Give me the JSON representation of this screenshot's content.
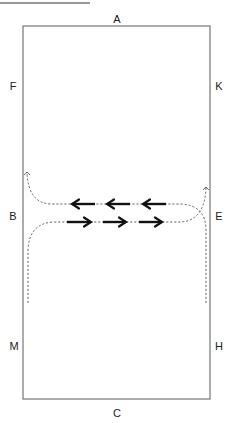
{
  "heading": {
    "text": "EXERCISE 10...",
    "underlined": true,
    "partially_cropped": true
  },
  "arena": {
    "shape": "rectangle",
    "rect": {
      "x": 23,
      "y": 26,
      "width": 187,
      "height": 373
    },
    "stroke_color": "#808080",
    "markers": [
      {
        "letter": "A",
        "x": 117,
        "y": 19
      },
      {
        "letter": "F",
        "x": 13,
        "y": 86
      },
      {
        "letter": "K",
        "x": 219,
        "y": 86
      },
      {
        "letter": "B",
        "x": 13,
        "y": 216
      },
      {
        "letter": "E",
        "x": 219,
        "y": 216
      },
      {
        "letter": "M",
        "x": 14,
        "y": 346
      },
      {
        "letter": "H",
        "x": 219,
        "y": 346
      },
      {
        "letter": "C",
        "x": 117,
        "y": 413
      }
    ]
  },
  "routes": [
    {
      "name": "upper-route",
      "direction": "right-to-left",
      "style": "dashed",
      "description": "From bottom right up the E side, turn left across the arena, then curve up on the B side",
      "path": "M206,303 L206,230 Q206,205 180,204 L52,204 Q28,204 27,172",
      "arrowhead_end": {
        "x": 27,
        "y": 170
      }
    },
    {
      "name": "lower-route",
      "direction": "left-to-right",
      "style": "dashed",
      "description": "From bottom left up the B side, turn right across the arena, then curve up on the E side",
      "path": "M28,303 L28,250 Q29,223 54,222 L180,222 Q205,221 206,187",
      "arrowhead_end": {
        "x": 206,
        "y": 185
      }
    }
  ],
  "direction_arrows": {
    "upper_row_left": [
      {
        "x1": 95,
        "x2": 72,
        "y": 204
      },
      {
        "x1": 130,
        "x2": 107,
        "y": 204
      },
      {
        "x1": 166,
        "x2": 143,
        "y": 204
      }
    ],
    "lower_row_right": [
      {
        "x1": 67,
        "x2": 91,
        "y": 222
      },
      {
        "x1": 103,
        "x2": 126,
        "y": 222
      },
      {
        "x1": 139,
        "x2": 162,
        "y": 222
      }
    ]
  },
  "colors": {
    "line": "#808080",
    "arrow": "#111111",
    "text": "#222222",
    "dashed": "#555555"
  }
}
